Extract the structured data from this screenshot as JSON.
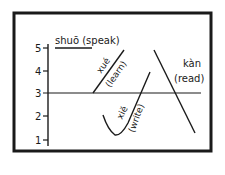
{
  "diagram": {
    "type": "tone-contour-chart",
    "scale": {
      "levels": [
        {
          "label": "5",
          "y": 48
        },
        {
          "label": "4",
          "y": 71
        },
        {
          "label": "3",
          "y": 93
        },
        {
          "label": "2",
          "y": 116
        },
        {
          "label": "1",
          "y": 140
        }
      ]
    },
    "words": {
      "shuo": {
        "pinyin": "shuō",
        "gloss": "(speak)",
        "full": "shuō (speak)"
      },
      "xue": {
        "pinyin": "xué",
        "gloss": "(learn)"
      },
      "xie": {
        "pinyin": "xiě",
        "gloss": "(write)"
      },
      "kan": {
        "pinyin": "kàn",
        "gloss": "(read)"
      }
    },
    "colors": {
      "ink": "#1a1a1a",
      "background": "#ffffff"
    }
  }
}
